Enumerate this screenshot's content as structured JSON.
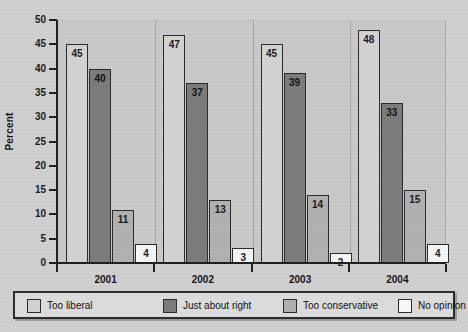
{
  "chart_data": {
    "type": "bar",
    "title": "",
    "subtitle": "",
    "xlabel": "",
    "ylabel": "Percent",
    "categories": [
      "2001",
      "2002",
      "2003",
      "2004"
    ],
    "ylim": [
      0,
      50
    ],
    "y_ticks": [
      "0",
      "5",
      "10",
      "15",
      "20",
      "25",
      "30",
      "35",
      "40",
      "45",
      "50"
    ],
    "grid": false,
    "legend_position": "bottom",
    "series": [
      {
        "name": "Too liberal",
        "values": [
          45,
          47,
          45,
          48
        ],
        "color": "#d2d2d2"
      },
      {
        "name": "Just about right",
        "values": [
          40,
          37,
          39,
          33
        ],
        "color": "#7b7b7b"
      },
      {
        "name": "Too conservative",
        "values": [
          11,
          13,
          14,
          15
        ],
        "color": "#b0b0b0"
      },
      {
        "name": "No opinion",
        "values": [
          4,
          3,
          2,
          4
        ],
        "color": "#f9f9f9"
      }
    ]
  },
  "axis": {
    "y_title": "Percent"
  },
  "legend": {
    "entries": [
      {
        "label": "Too liberal"
      },
      {
        "label": "Just about right"
      },
      {
        "label": "Too conservative"
      },
      {
        "label": "No opinion"
      }
    ]
  },
  "colors": {
    "background": "#cfcfcf",
    "plot_background": "#c8c8c8",
    "axis": "#1e1e1e",
    "legend_background": "#dcdcdc",
    "legend_border": "#2b2b2b"
  }
}
